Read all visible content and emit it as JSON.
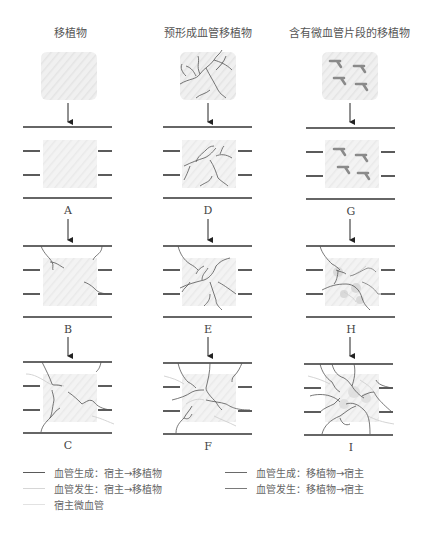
{
  "columns": [
    {
      "title": "移植物",
      "panels": [
        "A",
        "B",
        "C"
      ]
    },
    {
      "title": "预形成血管移植物",
      "panels": [
        "D",
        "E",
        "F"
      ]
    },
    {
      "title": "含有微血管片段的移植物",
      "panels": [
        "G",
        "H",
        "I"
      ]
    }
  ],
  "legend": [
    {
      "label": "血管生成：宿主→移植物",
      "color": "#5a5a5a"
    },
    {
      "label": "血管发生：宿主→移植物",
      "color": "#d6d6d6"
    },
    {
      "label": "宿主微血管",
      "color": "#e2e2e2"
    },
    {
      "label": "血管生成：移植物→宿主",
      "color": "#6a6a6a"
    },
    {
      "label": "血管发生：移植物→宿主",
      "color": "#7a7a7a"
    }
  ],
  "colors": {
    "line": "#333333",
    "graft_fill": "#eeeeee",
    "vessel": "#555555",
    "host_vessel": "#cfcfcf",
    "fragment": "#8a8a8a"
  }
}
